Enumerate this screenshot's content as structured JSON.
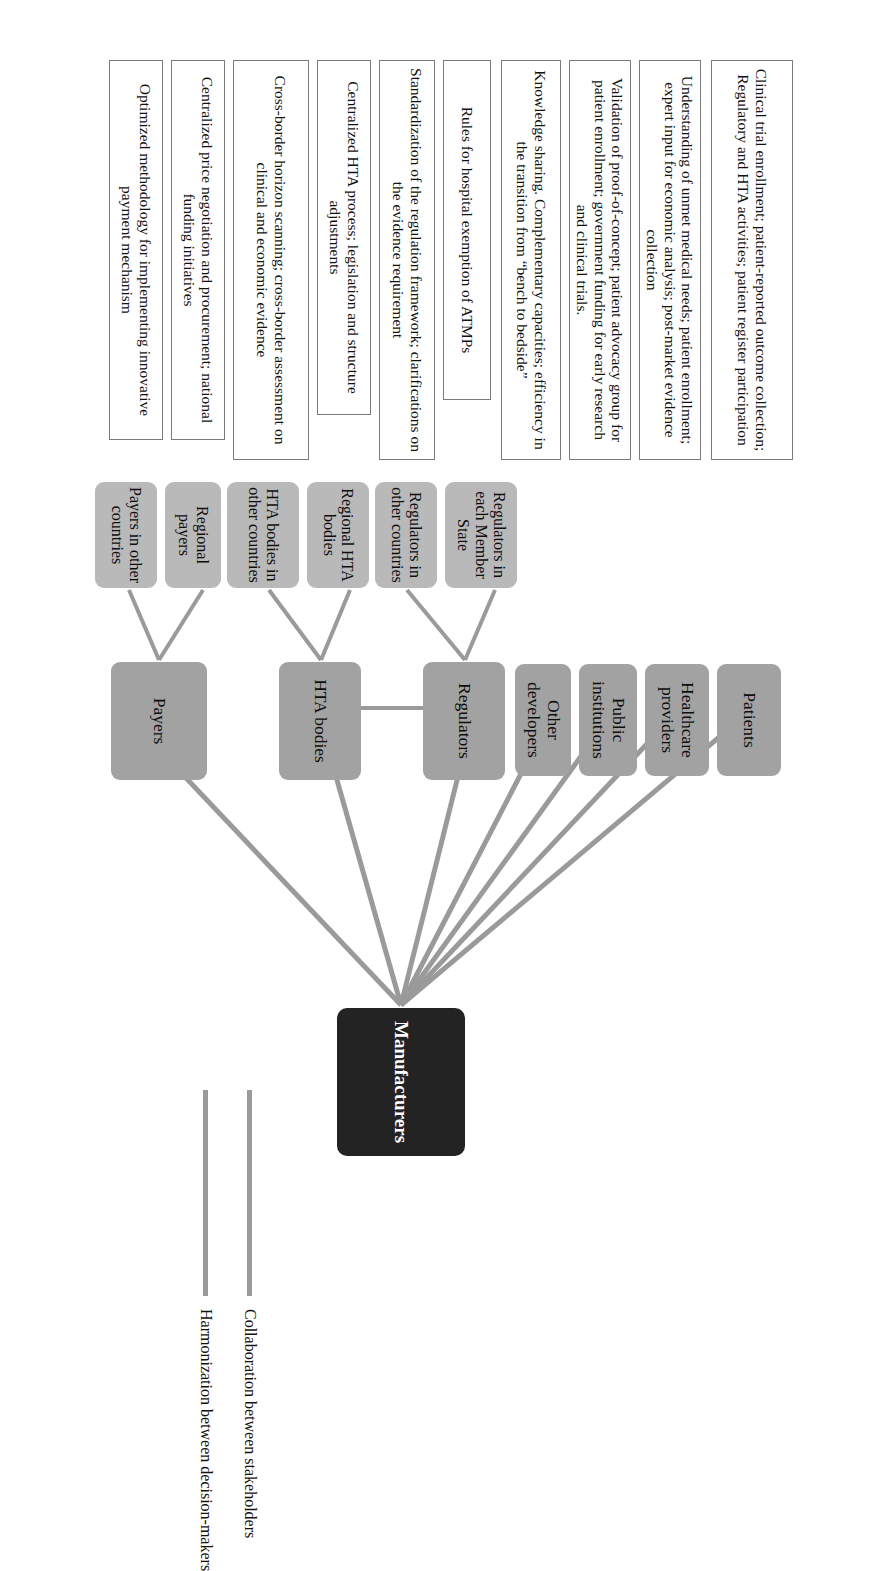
{
  "figure": {
    "root": {
      "label": "Manufacturers"
    },
    "stakeholders": [
      {
        "id": "patients",
        "label": "Patients"
      },
      {
        "id": "providers",
        "label": "Healthcare providers"
      },
      {
        "id": "public",
        "label": "Public institutions"
      },
      {
        "id": "other-dev",
        "label": "Other developers"
      },
      {
        "id": "regulators",
        "label": "Regulators"
      },
      {
        "id": "hta",
        "label": "HTA bodies"
      },
      {
        "id": "payers",
        "label": "Payers"
      }
    ],
    "sub_nodes": [
      {
        "id": "regulators-member-state",
        "label": "Regulators in each Member State"
      },
      {
        "id": "regulators-other",
        "label": "Regulators in other countries"
      },
      {
        "id": "regional-hta",
        "label": "Regional HTA bodies"
      },
      {
        "id": "hta-other",
        "label": "HTA bodies in other countries"
      },
      {
        "id": "regional-payers",
        "label": "Regional payers"
      },
      {
        "id": "payers-other",
        "label": "Payers in other countries"
      }
    ],
    "detail_boxes": [
      {
        "id": "patients-detail",
        "text": "Clinical trial enrollment; patient-reported outcome collection; Regulatory and HTA activities; patient register participation"
      },
      {
        "id": "providers-detail",
        "text": "Understanding of unmet medical needs; patient enrollment; expert input for economic analysis; post-market evidence collection"
      },
      {
        "id": "public-detail",
        "text": "Validation of proof-of-concept; patient advocacy group for patient enrollment; government funding for early research and clinical trials."
      },
      {
        "id": "other-dev-detail",
        "text": "Knowledge sharing. Complementary capacities; efficiency in the transition from “bench to bedside”"
      },
      {
        "id": "reg-member-detail",
        "text": "Rules for hospital exemption of ATMPs"
      },
      {
        "id": "reg-other-detail",
        "text": "Standardization of the regulation framework; clarifications on the evidence requirement"
      },
      {
        "id": "regional-hta-detail",
        "text": "Centralized HTA process; legislation and structure adjustments"
      },
      {
        "id": "hta-other-detail",
        "text": "Cross-border horizon scanning; cross-border assessment on clinical and economic evidence"
      },
      {
        "id": "regional-payers-detail",
        "text": "Centralized price negotiation and procurement; national funding initiatives"
      },
      {
        "id": "payers-other-detail",
        "text": "Optimized methodology for implementing innovative payment mechanism"
      }
    ],
    "legend": [
      {
        "id": "collaboration",
        "label": "Collaboration between stakeholders",
        "color": "#9a9a9a"
      },
      {
        "id": "harmonization",
        "label": "Harmonization between decision-makers",
        "color": "#9a9a9a"
      }
    ],
    "colors": {
      "root_fill": "#232323",
      "main_node_fill": "#a2a2a2",
      "sub_node_fill": "#b9b9b9",
      "detail_box_fill": "#ffffff",
      "connector": "#9a9a9a"
    }
  }
}
